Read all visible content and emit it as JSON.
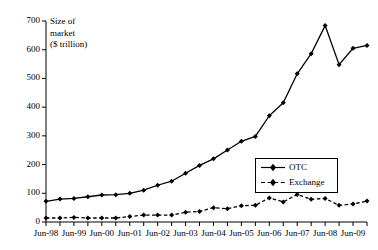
{
  "chart_data": {
    "type": "line",
    "title": "",
    "axis_title": "Size of\nmarket\n($ trillion)",
    "ylabel": "Size of market ($ trillion)",
    "xlabel": "",
    "ylim": [
      0,
      700
    ],
    "yticks": [
      0,
      100,
      200,
      300,
      400,
      500,
      600,
      700
    ],
    "ytick_labels": [
      "0",
      "100",
      "200",
      "300",
      "400",
      "500",
      "600",
      "700"
    ],
    "grid": false,
    "legend_position": "center-right",
    "x": [
      "Jun-98",
      "Dec-98",
      "Jun-99",
      "Dec-99",
      "Jun-00",
      "Dec-00",
      "Jun-01",
      "Dec-01",
      "Jun-02",
      "Dec-02",
      "Jun-03",
      "Dec-03",
      "Jun-04",
      "Dec-04",
      "Jun-05",
      "Dec-05",
      "Jun-06",
      "Dec-06",
      "Jun-07",
      "Dec-07",
      "Jun-08",
      "Dec-08",
      "Jun-09",
      "Dec-09"
    ],
    "xtick_labels": [
      "Jun-98",
      "Jun-99",
      "Jun-00",
      "Jun-01",
      "Jun-02",
      "Jun-03",
      "Jun-04",
      "Jun-05",
      "Jun-06",
      "Jun-07",
      "Jun-08",
      "Jun-09"
    ],
    "series": [
      {
        "name": "OTC",
        "style": "solid",
        "marker": "diamond",
        "color": "#000000",
        "values": [
          72,
          80,
          82,
          88,
          94,
          95,
          100,
          111,
          128,
          142,
          170,
          197,
          220,
          251,
          281,
          298,
          370,
          415,
          516,
          586,
          684,
          548,
          605,
          615
        ]
      },
      {
        "name": "Exchange",
        "style": "dashed",
        "marker": "diamond",
        "color": "#000000",
        "values": [
          14,
          14,
          16,
          14,
          14,
          14,
          19,
          24,
          24,
          24,
          34,
          37,
          50,
          46,
          57,
          58,
          84,
          70,
          96,
          79,
          82,
          58,
          63,
          73
        ]
      }
    ]
  },
  "legend": {
    "items": [
      {
        "label": "OTC"
      },
      {
        "label": "Exchange"
      }
    ]
  }
}
